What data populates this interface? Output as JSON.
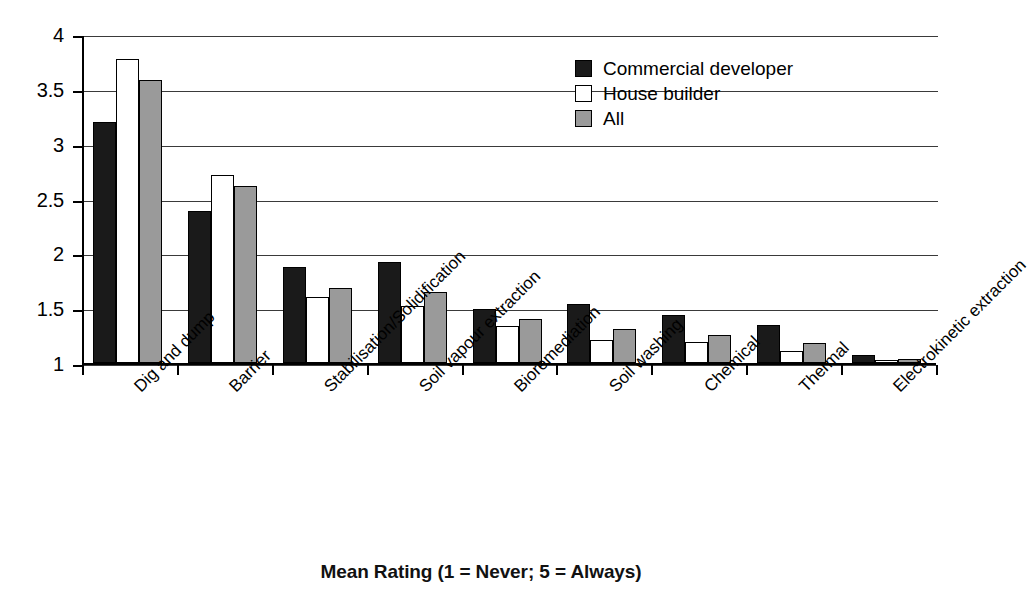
{
  "chart_data": {
    "type": "bar",
    "title": "Mean Rating (1 = Never; 5 = Always)",
    "xlabel": "",
    "ylabel": "",
    "ylim": [
      1,
      4
    ],
    "yticks": [
      "1",
      "1.5",
      "2",
      "2.5",
      "3",
      "3.5",
      "4"
    ],
    "ytick_values": [
      1,
      1.5,
      2,
      2.5,
      3,
      3.5,
      4
    ],
    "grid": true,
    "legend_position": "top-right",
    "categories": [
      "Dig and dump",
      "Barrier",
      "Stabilisation/Solidification",
      "Soil vapour extraction",
      "Bioremediation",
      "Soil washing",
      "Chemical",
      "Thermal",
      "Electrokinetic extraction"
    ],
    "series": [
      {
        "name": "Commercial developer",
        "color": "#1a1a1a",
        "values": [
          3.2,
          2.39,
          1.88,
          1.92,
          1.49,
          1.54,
          1.44,
          1.35,
          1.07
        ]
      },
      {
        "name": "House builder",
        "color": "#ffffff",
        "values": [
          3.77,
          2.71,
          1.6,
          1.52,
          1.34,
          1.21,
          1.19,
          1.11,
          1.03
        ]
      },
      {
        "name": "All",
        "color": "#9a9a9a",
        "values": [
          3.58,
          2.61,
          1.68,
          1.65,
          1.4,
          1.31,
          1.26,
          1.18,
          1.04
        ]
      }
    ]
  },
  "legend": {
    "items": [
      {
        "label": "Commercial developer"
      },
      {
        "label": "House builder"
      },
      {
        "label": "All"
      }
    ]
  }
}
